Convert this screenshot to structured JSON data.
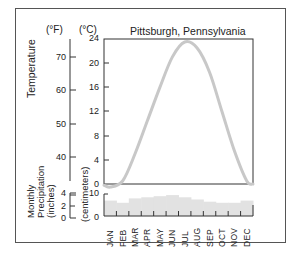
{
  "chart_data": {
    "type": "line",
    "title": "Pittsburgh, Pennsylvania",
    "subcharts": [
      {
        "name": "temperature",
        "type": "line",
        "ylabel": "Temperature",
        "y_units_left": "(°F)",
        "y_units_right": "(°C)",
        "celsius_ticks": [
          0,
          4,
          8,
          12,
          16,
          20,
          24
        ],
        "fahrenheit_ticks": [
          40,
          50,
          60,
          70
        ],
        "ylim_celsius": [
          0,
          24
        ],
        "categories": [
          "JAN",
          "FEB",
          "MAR",
          "APR",
          "MAY",
          "JUN",
          "JUL",
          "AUG",
          "SEP",
          "OCT",
          "NOV",
          "DEC"
        ],
        "values_celsius": [
          -0.5,
          0.5,
          5,
          10.5,
          16,
          21,
          23.5,
          22.5,
          18.5,
          12,
          5.5,
          0.5
        ],
        "line_color": "#c8c8c8"
      },
      {
        "name": "precipitation",
        "type": "bar",
        "ylabel": "Monthly Precipitation (inches)",
        "ylabel_right": "(centimeters)",
        "inch_ticks": [
          0,
          2,
          4
        ],
        "cm_ticks": [
          0,
          10
        ],
        "ylim_cm": [
          0,
          10
        ],
        "categories": [
          "JAN",
          "FEB",
          "MAR",
          "APR",
          "MAY",
          "JUN",
          "JUL",
          "AUG",
          "SEP",
          "OCT",
          "NOV",
          "DEC"
        ],
        "values_cm": [
          7,
          6,
          8,
          8.5,
          9,
          9.5,
          8.5,
          7.5,
          6.5,
          6,
          6,
          7
        ],
        "bar_color": "#e2e2e2"
      }
    ],
    "grid": false,
    "legend": null
  },
  "labels": {
    "title": "Pittsburgh, Pennsylvania",
    "unit_f": "(°F)",
    "unit_c": "(°C)",
    "temperature": "Temperature",
    "precip_line1": "Monthly",
    "precip_line2": "Precipitation",
    "precip_line3": "(inches)",
    "centimeters": "(centimeters)"
  },
  "axis": {
    "c": [
      "24",
      "20",
      "16",
      "12",
      "8",
      "4",
      "0"
    ],
    "f": [
      "70",
      "60",
      "50",
      "40"
    ],
    "in": [
      "4",
      "2",
      "0"
    ],
    "cm": [
      "10",
      "0"
    ]
  },
  "months": [
    "JAN",
    "FEB",
    "MAR",
    "APR",
    "MAY",
    "JUN",
    "JUL",
    "AUG",
    "SEP",
    "OCT",
    "NOV",
    "DEC"
  ]
}
